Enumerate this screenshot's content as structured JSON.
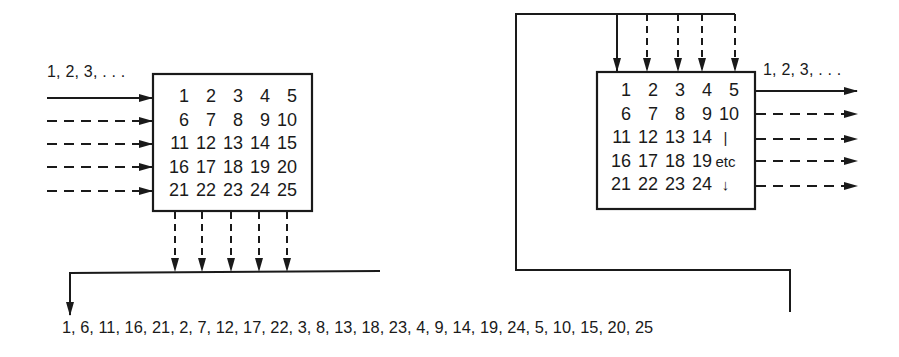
{
  "left_block": {
    "input_label": "1, 2, 3, . . .",
    "matrix": [
      [
        "1",
        "2",
        "3",
        "4",
        "5"
      ],
      [
        "6",
        "7",
        "8",
        "9",
        "10"
      ],
      [
        "11",
        "12",
        "13",
        "14",
        "15"
      ],
      [
        "16",
        "17",
        "18",
        "19",
        "20"
      ],
      [
        "21",
        "22",
        "23",
        "24",
        "25"
      ]
    ],
    "inputs": "row-wise (one solid arrow, four dashed)",
    "outputs": "column-wise (five dashed arrows down)"
  },
  "right_block": {
    "output_label": "1, 2, 3, . . .",
    "matrix": [
      [
        "1",
        "2",
        "3",
        "4",
        "5"
      ],
      [
        "6",
        "7",
        "8",
        "9",
        "10"
      ],
      [
        "11",
        "12",
        "13",
        "14",
        "|"
      ],
      [
        "16",
        "17",
        "18",
        "19",
        "etc"
      ],
      [
        "21",
        "22",
        "23",
        "24",
        "↓"
      ]
    ],
    "inputs": "column-wise (one solid arrow, four dashed, from top)",
    "outputs": "row-wise (one solid arrow, four dashed, to right)"
  },
  "sequence": {
    "text": "1, 6, 11, 16, 21, 2, 7, 12, 17, 22, 3, 8, 13, 18, 23, 4, 9, 14, 19, 24, 5, 10, 15, 20, 25"
  },
  "colors": {
    "ink": "#1a1a1a",
    "background": "#ffffff"
  }
}
